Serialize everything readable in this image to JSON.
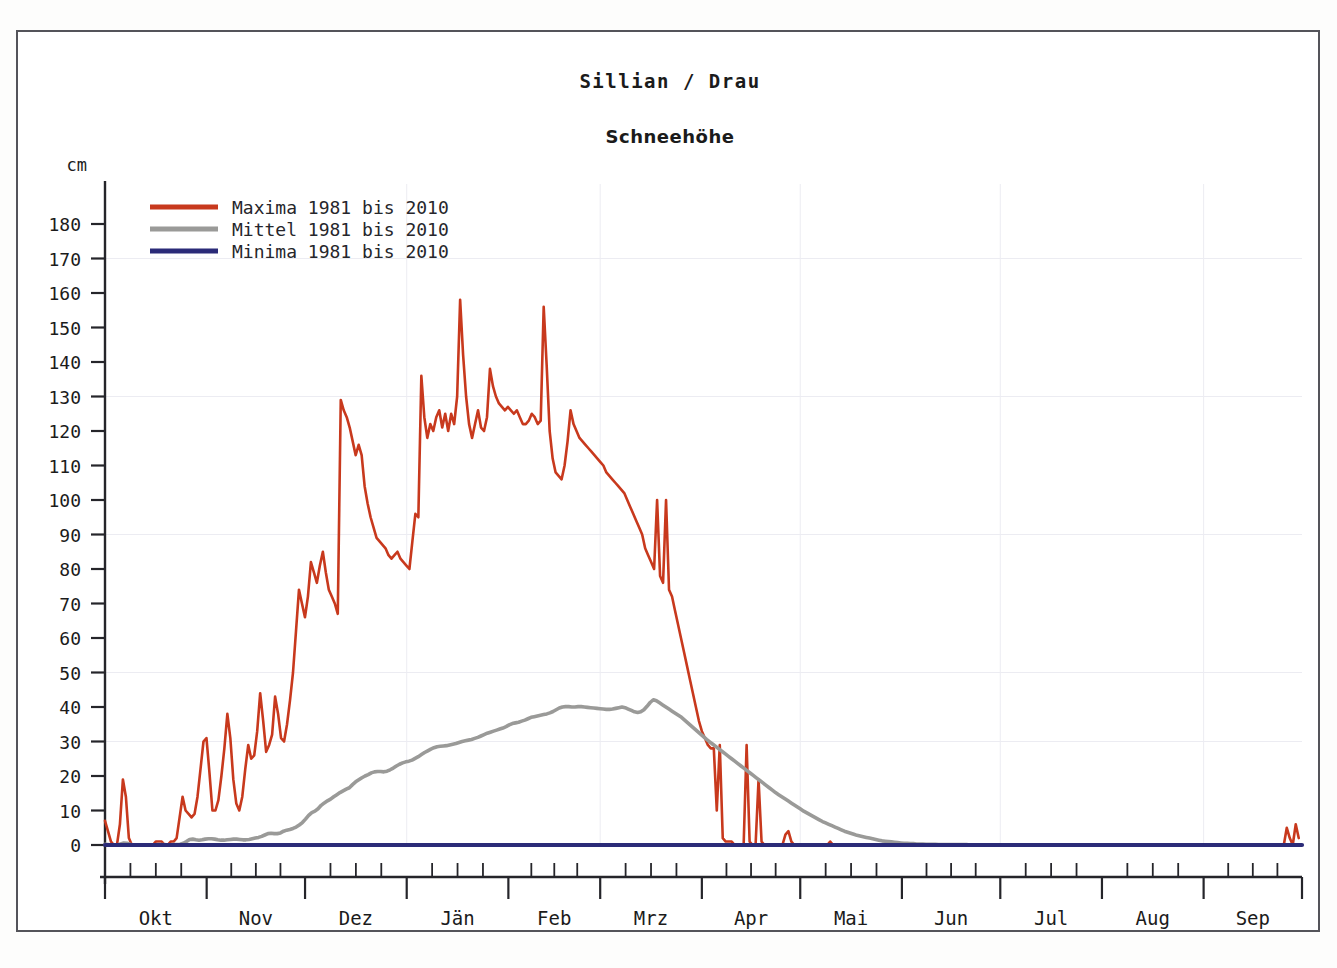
{
  "header": {
    "title": "Sillian / Drau",
    "subtitle": "Schneehöhe"
  },
  "legend": {
    "position": "top-left",
    "items": [
      {
        "label": "Maxima 1981 bis 2010",
        "color": "#c8391d",
        "name": "maxima"
      },
      {
        "label": "Mittel 1981 bis 2010",
        "color": "#9a9a98",
        "name": "mittel"
      },
      {
        "label": "Minima 1981 bis 2010",
        "color": "#2b2b78",
        "name": "minima"
      }
    ]
  },
  "axes": {
    "y_unit": "cm",
    "y_ticks": [
      "180",
      "170",
      "160",
      "150",
      "140",
      "130",
      "120",
      "110",
      "100",
      "90",
      "80",
      "70",
      "60",
      "50",
      "40",
      "30",
      "20",
      "10",
      "0"
    ],
    "x_labels": [
      "Okt",
      "Nov",
      "Dez",
      "Jän",
      "Feb",
      "Mrz",
      "Apr",
      "Mai",
      "Jun",
      "Jul",
      "Aug",
      "Sep"
    ]
  },
  "chart_data": {
    "type": "line",
    "title": "Sillian / Drau",
    "subtitle": "Schneehöhe",
    "xlabel": "",
    "ylabel": "cm",
    "ylim": [
      0,
      185
    ],
    "ytick_step": 10,
    "grid": false,
    "x_is_day_of_hydrological_year": true,
    "x_month_starts": {
      "Okt": 0,
      "Nov": 31,
      "Dez": 61,
      "Jän": 92,
      "Feb": 123,
      "Mrz": 151,
      "Apr": 182,
      "Mai": 212,
      "Jun": 243,
      "Jul": 273,
      "Aug": 304,
      "Sep": 335
    },
    "x_total_days": 365,
    "series": [
      {
        "name": "Maxima 1981 bis 2010",
        "color": "#c8391d",
        "values": [
          7,
          4,
          1,
          0,
          0,
          6,
          19,
          14,
          2,
          0,
          0,
          0,
          0,
          0,
          0,
          0,
          0,
          1,
          1,
          1,
          0,
          0,
          1,
          1,
          2,
          8,
          14,
          10,
          9,
          8,
          9,
          14,
          22,
          30,
          31,
          21,
          10,
          10,
          13,
          20,
          28,
          38,
          31,
          19,
          12,
          10,
          14,
          22,
          29,
          25,
          26,
          33,
          44,
          36,
          27,
          29,
          32,
          43,
          38,
          31,
          30,
          35,
          42,
          50,
          62,
          74,
          70,
          66,
          72,
          82,
          79,
          76,
          81,
          85,
          79,
          74,
          72,
          70,
          67,
          129,
          126,
          124,
          121,
          117,
          113,
          116,
          113,
          104,
          99,
          95,
          92,
          89,
          88,
          87,
          86,
          84,
          83,
          84,
          85,
          83,
          82,
          81,
          80,
          88,
          96,
          95,
          136,
          124,
          118,
          122,
          120,
          124,
          126,
          121,
          125,
          120,
          125,
          122,
          130,
          158,
          142,
          130,
          122,
          118,
          122,
          126,
          121,
          120,
          124,
          138,
          133,
          130,
          128,
          127,
          126,
          127,
          126,
          125,
          126,
          124,
          122,
          122,
          123,
          125,
          124,
          122,
          123,
          156,
          139,
          120,
          112,
          108,
          107,
          106,
          110,
          117,
          126,
          122,
          120,
          118,
          117,
          116,
          115,
          114,
          113,
          112,
          111,
          110,
          108,
          107,
          106,
          105,
          104,
          103,
          102,
          100,
          98,
          96,
          94,
          92,
          90,
          86,
          84,
          82,
          80,
          100,
          78,
          76,
          100,
          74,
          72,
          68,
          64,
          60,
          56,
          52,
          48,
          44,
          40,
          36,
          33,
          31,
          29,
          28,
          28,
          10,
          29,
          2,
          1,
          1,
          1,
          0,
          0,
          0,
          0,
          29,
          1,
          0,
          0,
          19,
          1,
          0,
          0,
          0,
          0,
          0,
          0,
          0,
          3,
          4,
          1,
          0,
          0,
          0,
          0,
          0,
          0,
          0,
          0,
          0,
          0,
          0,
          0,
          1,
          0,
          0,
          0,
          0,
          0,
          0,
          0,
          0,
          0,
          0,
          0,
          0,
          0,
          0,
          0,
          0,
          0,
          0,
          0,
          0,
          0,
          0,
          0,
          0,
          0,
          0,
          0,
          0,
          0,
          0,
          0,
          0,
          0,
          0,
          0,
          0,
          0,
          0,
          0,
          0,
          0,
          0,
          0,
          0,
          0,
          0,
          0,
          0,
          0,
          0,
          0,
          0,
          0,
          0,
          0,
          0,
          0,
          0,
          0,
          0,
          0,
          0,
          0,
          0,
          0,
          0,
          0,
          0,
          0,
          0,
          0,
          0,
          0,
          0,
          0,
          0,
          0,
          0,
          0,
          0,
          0,
          0,
          0,
          0,
          0,
          0,
          0,
          0,
          0,
          0,
          0,
          0,
          0,
          0,
          0,
          0,
          0,
          0,
          0,
          0,
          0,
          0,
          0,
          0,
          0,
          0,
          0,
          0,
          0,
          0,
          0,
          0,
          0,
          0,
          0,
          0,
          0,
          0,
          0,
          0,
          0,
          0,
          0,
          0,
          0,
          0,
          0,
          0,
          0,
          0,
          0,
          0,
          0,
          0,
          0,
          0,
          0,
          0,
          0,
          0,
          0,
          0,
          0,
          0,
          0,
          0,
          0,
          0,
          0,
          0,
          0,
          0,
          5,
          2,
          0,
          6,
          2
        ]
      },
      {
        "name": "Mittel 1981 bis 2010",
        "color": "#9a9a98",
        "values": [
          0.2,
          0.1,
          0,
          0,
          0,
          0.3,
          0.6,
          0.5,
          0.2,
          0,
          0,
          0,
          0,
          0,
          0,
          0,
          0,
          0.1,
          0.1,
          0.1,
          0,
          0,
          0.1,
          0.1,
          0.2,
          0.5,
          1.0,
          1.6,
          1.7,
          1.5,
          1.4,
          1.5,
          1.7,
          1.8,
          1.8,
          1.7,
          1.5,
          1.4,
          1.4,
          1.5,
          1.6,
          1.7,
          1.7,
          1.6,
          1.5,
          1.5,
          1.6,
          1.8,
          2.0,
          2.2,
          2.5,
          2.9,
          3.3,
          3.4,
          3.3,
          3.3,
          3.5,
          4.0,
          4.3,
          4.5,
          4.8,
          5.2,
          5.8,
          6.5,
          7.5,
          8.6,
          9.4,
          9.8,
          10.5,
          11.5,
          12.2,
          12.8,
          13.3,
          14.0,
          14.6,
          15.2,
          15.7,
          16.2,
          16.6,
          17.5,
          18.3,
          18.9,
          19.5,
          20.0,
          20.4,
          20.9,
          21.2,
          21.3,
          21.3,
          21.2,
          21.4,
          21.8,
          22.3,
          22.9,
          23.4,
          23.8,
          24.1,
          24.3,
          24.6,
          25.1,
          25.6,
          26.2,
          26.8,
          27.3,
          27.8,
          28.2,
          28.5,
          28.6,
          28.7,
          28.8,
          29.0,
          29.2,
          29.4,
          29.7,
          30.0,
          30.2,
          30.4,
          30.6,
          30.9,
          31.2,
          31.6,
          32.0,
          32.4,
          32.7,
          33.0,
          33.3,
          33.6,
          33.9,
          34.3,
          34.8,
          35.2,
          35.4,
          35.6,
          35.9,
          36.2,
          36.6,
          37.0,
          37.2,
          37.4,
          37.6,
          37.8,
          38.0,
          38.3,
          38.7,
          39.2,
          39.7,
          40.0,
          40.1,
          40.1,
          40.0,
          40.0,
          40.1,
          40.1,
          40.0,
          39.9,
          39.8,
          39.7,
          39.6,
          39.5,
          39.4,
          39.3,
          39.3,
          39.4,
          39.6,
          39.8,
          40.0,
          39.8,
          39.4,
          39.0,
          38.6,
          38.4,
          38.6,
          39.2,
          40.2,
          41.3,
          42.1,
          41.8,
          41.2,
          40.6,
          40.0,
          39.4,
          38.8,
          38.2,
          37.6,
          37.0,
          36.2,
          35.4,
          34.6,
          33.8,
          33.0,
          32.2,
          31.4,
          30.6,
          29.9,
          29.2,
          28.5,
          27.8,
          27.1,
          26.4,
          25.7,
          25.0,
          24.3,
          23.6,
          22.9,
          22.2,
          21.5,
          20.8,
          20.1,
          19.4,
          18.7,
          18.0,
          17.3,
          16.6,
          15.9,
          15.2,
          14.6,
          14.0,
          13.4,
          12.8,
          12.2,
          11.6,
          11.0,
          10.4,
          9.8,
          9.3,
          8.8,
          8.3,
          7.8,
          7.3,
          6.8,
          6.4,
          6.0,
          5.6,
          5.2,
          4.8,
          4.4,
          4.0,
          3.7,
          3.4,
          3.1,
          2.8,
          2.6,
          2.4,
          2.2,
          2.0,
          1.8,
          1.6,
          1.4,
          1.2,
          1.1,
          1.0,
          0.9,
          0.8,
          0.7,
          0.6,
          0.5,
          0.5,
          0.4,
          0.4,
          0.3,
          0.3,
          0.3,
          0.2,
          0.2,
          0.2,
          0.2,
          0.1,
          0.1,
          0.1,
          0.1,
          0.1,
          0.1,
          0.1,
          0.1,
          0.1,
          0.1,
          0,
          0,
          0,
          0,
          0,
          0,
          0,
          0,
          0,
          0,
          0,
          0,
          0,
          0,
          0,
          0,
          0,
          0,
          0,
          0,
          0,
          0,
          0,
          0,
          0,
          0,
          0,
          0,
          0,
          0,
          0,
          0,
          0,
          0,
          0,
          0,
          0,
          0,
          0,
          0,
          0,
          0,
          0,
          0,
          0,
          0,
          0,
          0,
          0,
          0,
          0,
          0,
          0,
          0,
          0,
          0,
          0,
          0,
          0,
          0,
          0,
          0,
          0,
          0,
          0,
          0,
          0,
          0,
          0,
          0,
          0,
          0,
          0,
          0,
          0,
          0,
          0,
          0,
          0,
          0,
          0,
          0,
          0,
          0,
          0,
          0,
          0,
          0,
          0,
          0,
          0,
          0,
          0,
          0,
          0,
          0,
          0,
          0,
          0,
          0,
          0,
          0,
          0,
          0,
          0,
          0
        ]
      },
      {
        "name": "Minima 1981 bis 2010",
        "color": "#2b2b78",
        "constant_value": 0,
        "values": []
      }
    ]
  }
}
